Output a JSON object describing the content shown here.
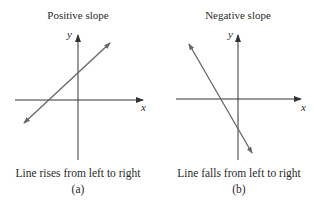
{
  "panels": [
    {
      "id": "a",
      "title": "Positive slope",
      "caption": "Line rises from left to right",
      "label": "(a)",
      "x_axis_label": "x",
      "y_axis_label": "y",
      "slope_sign": "positive"
    },
    {
      "id": "b",
      "title": "Negative slope",
      "caption": "Line falls from left to right",
      "label": "(b)",
      "x_axis_label": "x",
      "y_axis_label": "y",
      "slope_sign": "negative"
    }
  ],
  "colors": {
    "axis": "#333333",
    "line": "#666666",
    "text": "#2a2a2a"
  }
}
